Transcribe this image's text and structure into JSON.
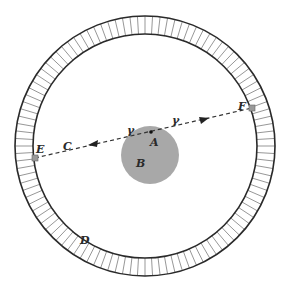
{
  "diagram": {
    "labels": {
      "A": "A",
      "B": "B",
      "C": "C",
      "D": "D",
      "E": "E",
      "F": "F",
      "gamma_left": "γ",
      "gamma_right": "γ"
    },
    "colors": {
      "background": "#ffffff",
      "ring_stroke": "#2a2a2a",
      "tick_stroke": "#6a6a6a",
      "disc_fill": "#a8a8a8",
      "line_stroke": "#333333",
      "marker_fill": "#9a9a9a"
    },
    "geometry": {
      "ring_center": [
        145,
        146
      ],
      "outer_radius": 130,
      "inner_radius": 112,
      "tick_count": 108,
      "disc_center": [
        150,
        155
      ],
      "disc_radius": 29,
      "point_A": [
        151,
        132
      ],
      "point_E": [
        35,
        158
      ],
      "point_F": [
        252,
        108
      ]
    }
  }
}
